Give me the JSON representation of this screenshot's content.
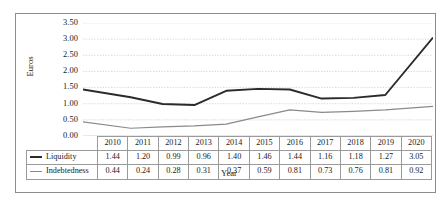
{
  "chart_data": {
    "type": "line",
    "title": "",
    "xlabel": "Year",
    "ylabel": "Euros",
    "categories": [
      "2010",
      "2011",
      "2012",
      "2013",
      "2014",
      "2015",
      "2016",
      "2017",
      "2018",
      "2019",
      "2020"
    ],
    "series": [
      {
        "name": "Liquidity",
        "color": "#2b2b2b",
        "values": [
          1.44,
          1.2,
          0.99,
          0.96,
          1.4,
          1.46,
          1.44,
          1.16,
          1.18,
          1.27,
          3.05
        ]
      },
      {
        "name": "Indebtedness",
        "color": "#8a8a8a",
        "values": [
          0.44,
          0.24,
          0.28,
          0.31,
          0.37,
          0.59,
          0.81,
          0.73,
          0.76,
          0.81,
          0.92
        ]
      }
    ],
    "ylim": [
      0.0,
      3.5
    ],
    "ytick_step": 0.5,
    "ytick_labels": [
      "0.00",
      "0.50",
      "1.00",
      "1.50",
      "2.00",
      "2.50",
      "3.00",
      "3.50"
    ],
    "grid": true,
    "grid_color": "#c9c9c9",
    "legend_position": "table-left",
    "value_format": "2dp"
  },
  "table": {
    "header_row": [
      "2010",
      "2011",
      "2012",
      "2013",
      "2014",
      "2015",
      "2016",
      "2017",
      "2018",
      "2019",
      "2020"
    ],
    "rows": [
      {
        "label": "Liquidity",
        "values": [
          "1.44",
          "1.20",
          "0.99",
          "0.96",
          "1.40",
          "1.46",
          "1.44",
          "1.16",
          "1.18",
          "1.27",
          "3.05"
        ]
      },
      {
        "label": "Indebtedness",
        "values": [
          "0.44",
          "0.24",
          "0.28",
          "0.31",
          "0.37",
          "0.59",
          "0.81",
          "0.73",
          "0.76",
          "0.81",
          "0.92"
        ]
      }
    ]
  },
  "axis": {
    "y_title": "Euros",
    "x_title": "Year"
  }
}
